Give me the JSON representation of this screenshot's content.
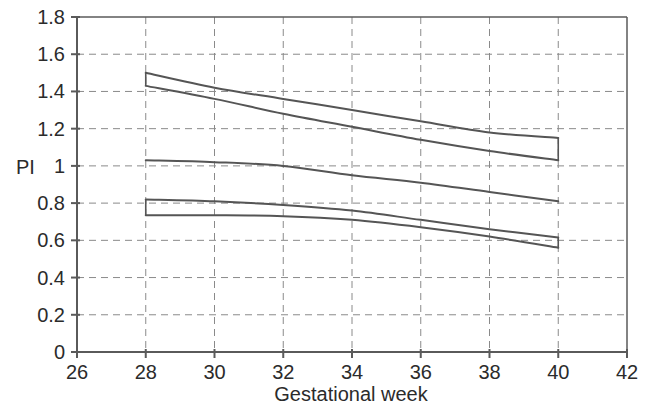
{
  "chart_data": {
    "type": "line",
    "title": "",
    "subtitle": "",
    "xlabel": "Gestational week",
    "ylabel": "PI",
    "xlim": [
      26,
      42
    ],
    "ylim": [
      0,
      1.8
    ],
    "xticks": [
      26,
      28,
      30,
      32,
      34,
      36,
      38,
      40,
      42
    ],
    "yticks": [
      0,
      0.2,
      0.4,
      0.6,
      0.8,
      1,
      1.2,
      1.4,
      1.6,
      1.8
    ],
    "xtick_labels": [
      "26",
      "28",
      "30",
      "32",
      "34",
      "36",
      "38",
      "40",
      "42"
    ],
    "ytick_labels": [
      "0",
      "0.2",
      "0.4",
      "0.6",
      "0.8",
      "1",
      "1.2",
      "1.4",
      "1.6",
      "1.8"
    ],
    "grid": true,
    "grid_style": "dashed",
    "grid_color": "#8a8a8a",
    "line_color": "#555555",
    "axis_color": "#5a5a5a",
    "legend": [],
    "legend_position": "none",
    "annotations": [],
    "x": [
      28,
      30,
      32,
      34,
      36,
      38,
      40
    ],
    "series": [
      {
        "name": "curve-1",
        "values": [
          1.5,
          1.42,
          1.36,
          1.3,
          1.24,
          1.18,
          1.15
        ]
      },
      {
        "name": "curve-2",
        "values": [
          1.43,
          1.36,
          1.28,
          1.21,
          1.14,
          1.08,
          1.03
        ]
      },
      {
        "name": "curve-3",
        "values": [
          1.03,
          1.02,
          1.0,
          0.95,
          0.91,
          0.86,
          0.81
        ]
      },
      {
        "name": "curve-4",
        "values": [
          0.82,
          0.81,
          0.79,
          0.76,
          0.71,
          0.66,
          0.615
        ]
      },
      {
        "name": "curve-5",
        "values": [
          0.735,
          0.735,
          0.73,
          0.71,
          0.67,
          0.62,
          0.56
        ]
      }
    ]
  },
  "geometry": {
    "plot_left": 77,
    "plot_right": 627,
    "plot_top": 17,
    "plot_bottom": 352
  }
}
